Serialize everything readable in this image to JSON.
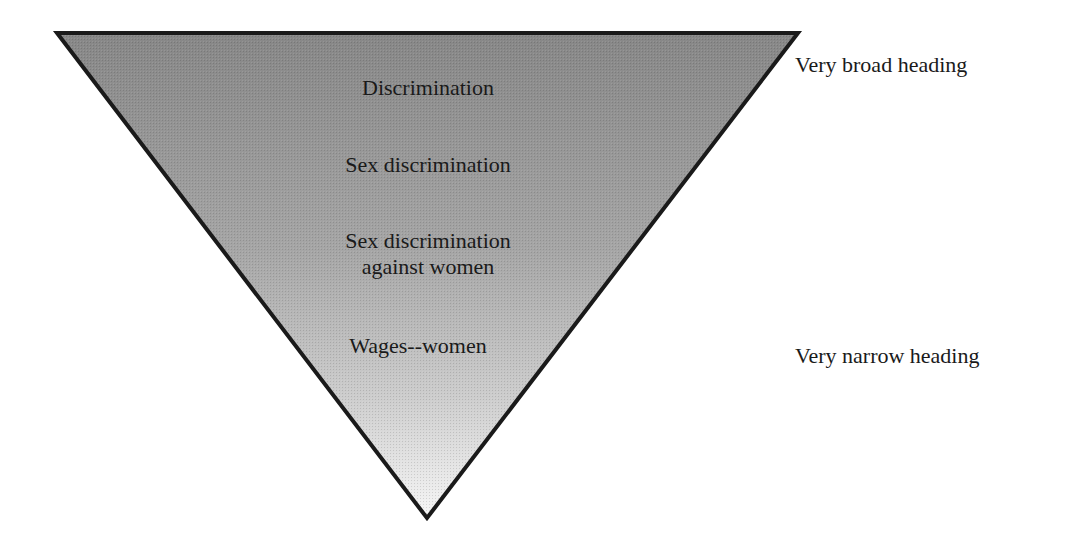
{
  "diagram": {
    "type": "inverted-triangle",
    "colors": {
      "fill_top": "#8a8a8a",
      "fill_bottom": "#f4f4f4",
      "stroke": "#1a1a1a"
    },
    "levels": [
      {
        "label": "Discrimination"
      },
      {
        "label": "Sex discrimination"
      },
      {
        "label_line1": "Sex discrimination",
        "label_line2": "against women"
      },
      {
        "label": "Wages--women"
      }
    ],
    "annotations": {
      "broad": "Very broad heading",
      "narrow": "Very narrow heading"
    }
  }
}
